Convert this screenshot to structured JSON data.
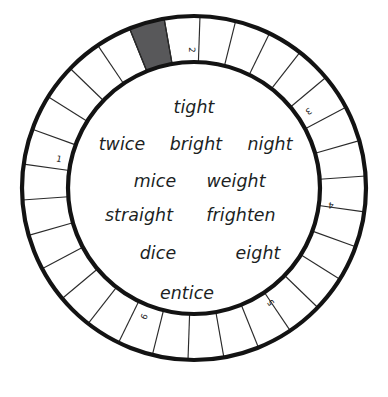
{
  "geometry": {
    "center_x": 194,
    "center_y": 188,
    "outer_radius": 172,
    "inner_radius": 126,
    "segment_count": 30,
    "highlight_index": 29
  },
  "colors": {
    "outline": "#131313",
    "divider": "#2b2b2b",
    "highlight_fill": "#58585a",
    "text": "#201f1f",
    "background": "#ffffff"
  },
  "ring": {
    "highlighted_segment_label": "",
    "numbers": [
      {
        "label": "1",
        "angle_deg": -78
      },
      {
        "label": "2",
        "angle_deg": -1
      },
      {
        "label": "3",
        "angle_deg": 56
      },
      {
        "label": "4",
        "angle_deg": 97
      },
      {
        "label": "5",
        "angle_deg": 146
      },
      {
        "label": "6",
        "angle_deg": -159
      }
    ]
  },
  "words": [
    {
      "text": "tight",
      "x": 194,
      "y": 108
    },
    {
      "text": "twice",
      "x": 122,
      "y": 145
    },
    {
      "text": "bright",
      "x": 196,
      "y": 145
    },
    {
      "text": "night",
      "x": 270,
      "y": 145
    },
    {
      "text": "mice",
      "x": 155,
      "y": 182
    },
    {
      "text": "weight",
      "x": 236,
      "y": 182
    },
    {
      "text": "straight",
      "x": 139,
      "y": 216
    },
    {
      "text": "frighten",
      "x": 241,
      "y": 216
    },
    {
      "text": "dice",
      "x": 158,
      "y": 254
    },
    {
      "text": "eight",
      "x": 258,
      "y": 254
    },
    {
      "text": "entice",
      "x": 187,
      "y": 294
    }
  ]
}
